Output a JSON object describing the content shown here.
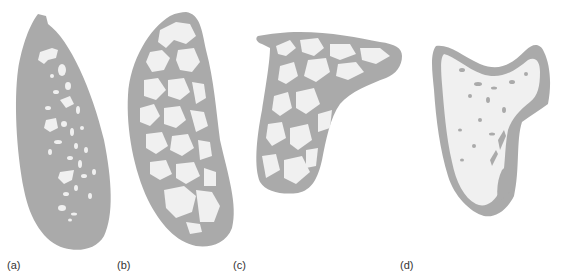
{
  "figure": {
    "colors": {
      "background": "#ffffff",
      "cortical": "#aaaaaa",
      "trabecular_space": "#f0f0f0",
      "label": "#333333"
    },
    "panels": [
      {
        "id": "a",
        "label": "(a)",
        "label_x": 7
      },
      {
        "id": "b",
        "label": "(b)",
        "label_x": 117
      },
      {
        "id": "c",
        "label": "(c)",
        "label_x": 233
      },
      {
        "id": "d",
        "label": "(d)",
        "label_x": 400
      }
    ]
  }
}
